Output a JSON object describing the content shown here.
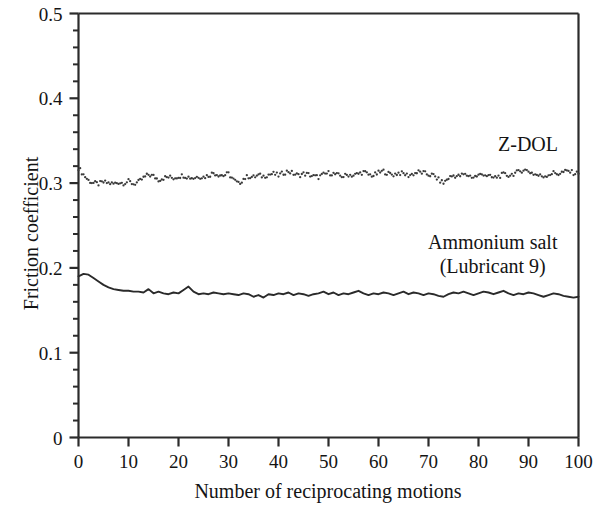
{
  "chart_data": {
    "type": "line",
    "title": "",
    "xlabel": "Number of reciprocating motions",
    "ylabel": "Friction coefficient",
    "xlim": [
      0,
      100
    ],
    "ylim": [
      0,
      0.5
    ],
    "grid": false,
    "legend_position": "inline-annotation",
    "x_ticks": [
      "0",
      "10",
      "20",
      "30",
      "40",
      "50",
      "60",
      "70",
      "80",
      "90",
      "100"
    ],
    "x_tick_values": [
      0,
      10,
      20,
      30,
      40,
      50,
      60,
      70,
      80,
      90,
      100
    ],
    "y_ticks": [
      "0",
      "0.1",
      "0.2",
      "0.3",
      "0.4",
      "0.5"
    ],
    "y_tick_values": [
      0,
      0.1,
      0.2,
      0.3,
      0.4,
      0.5
    ],
    "y_minor_interval": 0.02,
    "series": [
      {
        "name": "Z-DOL",
        "style": "dotted",
        "color": "#3a3a3a",
        "annotation": "Z-DOL",
        "x": [
          0,
          1,
          2,
          3,
          4,
          5,
          6,
          7,
          8,
          9,
          10,
          11,
          12,
          13,
          14,
          15,
          16,
          17,
          18,
          19,
          20,
          21,
          22,
          23,
          24,
          25,
          26,
          27,
          28,
          29,
          30,
          31,
          32,
          33,
          34,
          35,
          36,
          37,
          38,
          39,
          40,
          41,
          42,
          43,
          44,
          45,
          46,
          47,
          48,
          49,
          50,
          51,
          52,
          53,
          54,
          55,
          56,
          57,
          58,
          59,
          60,
          61,
          62,
          63,
          64,
          65,
          66,
          67,
          68,
          69,
          70,
          71,
          72,
          73,
          74,
          75,
          76,
          77,
          78,
          79,
          80,
          81,
          82,
          83,
          84,
          85,
          86,
          87,
          88,
          89,
          90,
          91,
          92,
          93,
          94,
          95,
          96,
          97,
          98,
          99,
          100
        ],
        "values": [
          0.318,
          0.31,
          0.303,
          0.3,
          0.299,
          0.301,
          0.3,
          0.299,
          0.301,
          0.3,
          0.302,
          0.299,
          0.301,
          0.306,
          0.31,
          0.308,
          0.304,
          0.306,
          0.307,
          0.306,
          0.308,
          0.309,
          0.307,
          0.306,
          0.308,
          0.307,
          0.309,
          0.312,
          0.31,
          0.309,
          0.311,
          0.304,
          0.299,
          0.305,
          0.308,
          0.307,
          0.309,
          0.308,
          0.31,
          0.311,
          0.309,
          0.312,
          0.314,
          0.311,
          0.309,
          0.311,
          0.31,
          0.308,
          0.307,
          0.31,
          0.312,
          0.311,
          0.309,
          0.308,
          0.31,
          0.309,
          0.311,
          0.313,
          0.31,
          0.309,
          0.312,
          0.314,
          0.311,
          0.31,
          0.312,
          0.311,
          0.309,
          0.311,
          0.313,
          0.312,
          0.31,
          0.309,
          0.304,
          0.3,
          0.306,
          0.309,
          0.308,
          0.31,
          0.309,
          0.307,
          0.309,
          0.311,
          0.308,
          0.306,
          0.308,
          0.31,
          0.309,
          0.311,
          0.313,
          0.316,
          0.314,
          0.311,
          0.309,
          0.308,
          0.31,
          0.312,
          0.311,
          0.313,
          0.314,
          0.312,
          0.311
        ]
      },
      {
        "name": "Ammonium salt (Lubricant 9)",
        "style": "solid",
        "color": "#2a2a2a",
        "annotation_line1": "Ammonium salt",
        "annotation_line2": "(Lubricant 9)",
        "x": [
          0,
          1,
          2,
          3,
          4,
          5,
          6,
          7,
          8,
          9,
          10,
          11,
          12,
          13,
          14,
          15,
          16,
          17,
          18,
          19,
          20,
          21,
          22,
          23,
          24,
          25,
          26,
          27,
          28,
          29,
          30,
          31,
          32,
          33,
          34,
          35,
          36,
          37,
          38,
          39,
          40,
          41,
          42,
          43,
          44,
          45,
          46,
          47,
          48,
          49,
          50,
          51,
          52,
          53,
          54,
          55,
          56,
          57,
          58,
          59,
          60,
          61,
          62,
          63,
          64,
          65,
          66,
          67,
          68,
          69,
          70,
          71,
          72,
          73,
          74,
          75,
          76,
          77,
          78,
          79,
          80,
          81,
          82,
          83,
          84,
          85,
          86,
          87,
          88,
          89,
          90,
          91,
          92,
          93,
          94,
          95,
          96,
          97,
          98,
          99,
          100
        ],
        "values": [
          0.19,
          0.193,
          0.192,
          0.188,
          0.184,
          0.18,
          0.177,
          0.175,
          0.174,
          0.173,
          0.173,
          0.172,
          0.172,
          0.171,
          0.175,
          0.17,
          0.172,
          0.17,
          0.169,
          0.171,
          0.17,
          0.174,
          0.178,
          0.172,
          0.169,
          0.17,
          0.169,
          0.171,
          0.17,
          0.169,
          0.17,
          0.169,
          0.168,
          0.17,
          0.169,
          0.166,
          0.168,
          0.165,
          0.169,
          0.168,
          0.17,
          0.169,
          0.171,
          0.168,
          0.17,
          0.169,
          0.167,
          0.169,
          0.17,
          0.172,
          0.169,
          0.171,
          0.168,
          0.17,
          0.169,
          0.171,
          0.173,
          0.17,
          0.168,
          0.17,
          0.169,
          0.171,
          0.17,
          0.168,
          0.17,
          0.172,
          0.169,
          0.171,
          0.17,
          0.168,
          0.17,
          0.169,
          0.167,
          0.166,
          0.169,
          0.171,
          0.17,
          0.172,
          0.17,
          0.168,
          0.17,
          0.172,
          0.171,
          0.169,
          0.171,
          0.173,
          0.17,
          0.168,
          0.17,
          0.169,
          0.171,
          0.17,
          0.168,
          0.166,
          0.168,
          0.17,
          0.169,
          0.167,
          0.166,
          0.165,
          0.166
        ]
      }
    ]
  },
  "axes": {
    "y_title": "Friction coefficient",
    "x_title": "Number of reciprocating motions"
  }
}
